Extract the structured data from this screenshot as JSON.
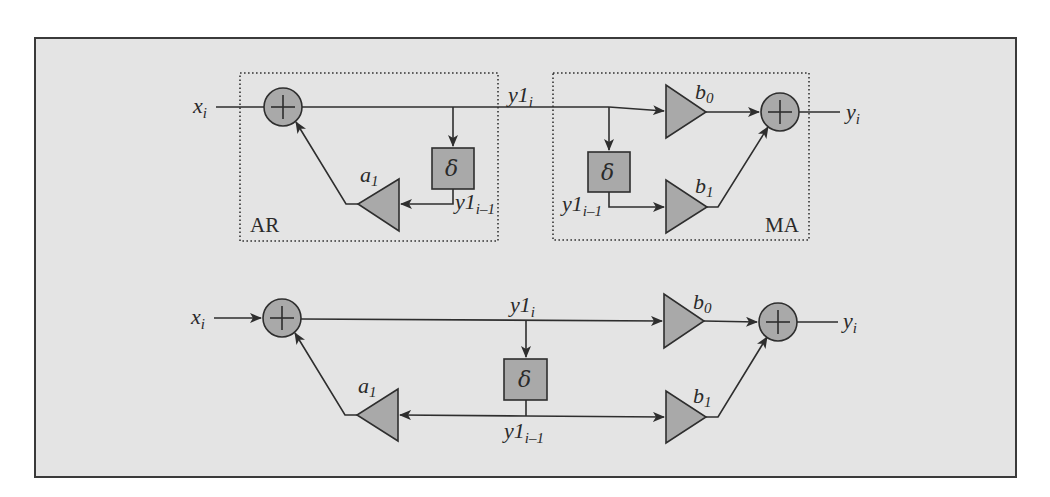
{
  "top": {
    "input_label": "x",
    "input_sub": "i",
    "output_label": "y",
    "output_sub": "i",
    "intermediate_label": "y1",
    "intermediate_sub": "i",
    "delayed_label_ar": "y1",
    "delayed_sub_ar": "i–1",
    "delayed_label_ma": "y1",
    "delayed_sub_ma": "i–1",
    "delay_symbol_ar": "δ",
    "delay_symbol_ma": "δ",
    "gain_a1": "a",
    "gain_a1_sub": "1",
    "gain_b0": "b",
    "gain_b0_sub": "0",
    "gain_b1": "b",
    "gain_b1_sub": "1",
    "section_ar": "AR",
    "section_ma": "MA"
  },
  "bottom": {
    "input_label": "x",
    "input_sub": "i",
    "output_label": "y",
    "output_sub": "i",
    "intermediate_label": "y1",
    "intermediate_sub": "i",
    "delayed_label": "y1",
    "delayed_sub": "i–1",
    "delay_symbol": "δ",
    "gain_a1": "a",
    "gain_a1_sub": "1",
    "gain_b0": "b",
    "gain_b0_sub": "0",
    "gain_b1": "b",
    "gain_b1_sub": "1"
  },
  "colors": {
    "background": "#e4e4e4",
    "block_fill": "#a9a9a9",
    "stroke": "#2e2e2e"
  }
}
